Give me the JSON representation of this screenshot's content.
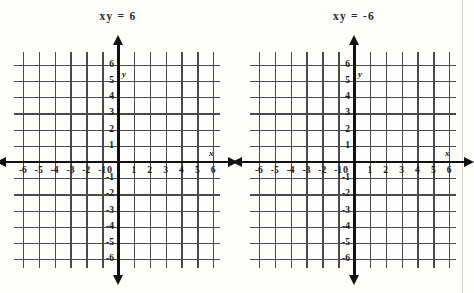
{
  "figure": {
    "type": "two-blank-coordinate-grids",
    "background_color": "#fdfdfb",
    "ink_color": "#111111",
    "grid_color": "#4a4a4a"
  },
  "panels": [
    {
      "id": "left",
      "title": "xy = 6",
      "axis_label_x": "x",
      "axis_label_y": "y",
      "origin_label": "0",
      "x_ticks": [
        "-6",
        "-5",
        "-4",
        "-3",
        "-2",
        "-1",
        "1",
        "2",
        "3",
        "4",
        "5",
        "6"
      ],
      "y_ticks": [
        "6",
        "5",
        "4",
        "3",
        "2",
        "1",
        "-1",
        "-2",
        "-3",
        "-4",
        "-5",
        "-6"
      ]
    },
    {
      "id": "right",
      "title": "xy = -6",
      "axis_label_x": "x",
      "axis_label_y": "y",
      "origin_label": "0",
      "x_ticks": [
        "-6",
        "-5",
        "-4",
        "-3",
        "-2",
        "-1",
        "1",
        "2",
        "3",
        "4",
        "5",
        "6"
      ],
      "y_ticks": [
        "6",
        "5",
        "4",
        "3",
        "2",
        "1",
        "-1",
        "-2",
        "-3",
        "-4",
        "-5",
        "-6"
      ]
    }
  ],
  "chart_data": [
    {
      "type": "line",
      "title": "xy = 6",
      "xlabel": "x",
      "ylabel": "y",
      "xlim": [
        -6,
        6
      ],
      "ylim": [
        -6,
        6
      ],
      "xticks": [
        -6,
        -5,
        -4,
        -3,
        -2,
        -1,
        0,
        1,
        2,
        3,
        4,
        5,
        6
      ],
      "yticks": [
        -6,
        -5,
        -4,
        -3,
        -2,
        -1,
        0,
        1,
        2,
        3,
        4,
        5,
        6
      ],
      "grid": true,
      "legend": null,
      "series": [],
      "annotations": [
        "blank grid - no curve plotted"
      ]
    },
    {
      "type": "line",
      "title": "xy = -6",
      "xlabel": "x",
      "ylabel": "y",
      "xlim": [
        -6,
        6
      ],
      "ylim": [
        -6,
        6
      ],
      "xticks": [
        -6,
        -5,
        -4,
        -3,
        -2,
        -1,
        0,
        1,
        2,
        3,
        4,
        5,
        6
      ],
      "yticks": [
        -6,
        -5,
        -4,
        -3,
        -2,
        -1,
        0,
        1,
        2,
        3,
        4,
        5,
        6
      ],
      "grid": true,
      "legend": null,
      "series": [],
      "annotations": [
        "blank grid - no curve plotted"
      ]
    }
  ]
}
